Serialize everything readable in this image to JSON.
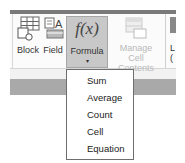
{
  "ribbon": {
    "buttons": [
      {
        "id": "block",
        "label": "Block",
        "icon": "block-table-icon",
        "state": "normal"
      },
      {
        "id": "field",
        "label": "Field",
        "icon": "field-icon",
        "state": "normal"
      },
      {
        "id": "formula",
        "label": "Formula",
        "icon": "formula-fx-icon",
        "glyph": "f(x)",
        "state": "pressed",
        "has_dropdown": true
      },
      {
        "id": "manage",
        "label_line1": "Manage",
        "label_line2": "Cell Contents",
        "icon": "manage-cell-contents-icon",
        "state": "disabled"
      },
      {
        "id": "partial",
        "label_line1": "L",
        "label_line2": "(",
        "state": "cut-off"
      }
    ]
  },
  "formula_menu": {
    "items": [
      {
        "label": "Sum"
      },
      {
        "label": "Average"
      },
      {
        "label": "Count"
      },
      {
        "label": "Cell"
      },
      {
        "label": "Equation"
      }
    ]
  },
  "colors": {
    "top_bar": "#7a7a7a",
    "pressed_button": "#c8c8c8",
    "disabled_text": "#b9b9b9",
    "menu_border": "#6e6e6e"
  }
}
